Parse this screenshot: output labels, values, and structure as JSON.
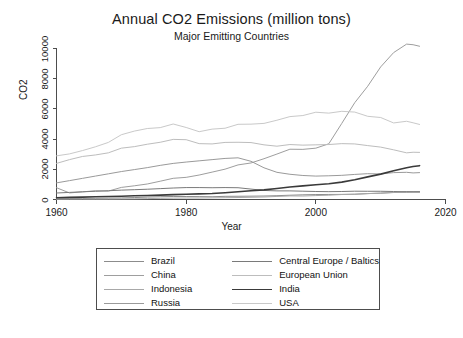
{
  "chart_data": {
    "type": "line",
    "title": "Annual CO2 Emissions (million tons)",
    "subtitle": "Major Emitting Countries",
    "xlabel": "Year",
    "ylabel": "CO2",
    "xlim": [
      1960,
      2020
    ],
    "ylim": [
      0,
      10000
    ],
    "xticks": [
      1960,
      1980,
      2000,
      2020
    ],
    "yticks": [
      0,
      2000,
      4000,
      6000,
      8000,
      10000
    ],
    "xtick_labels": [
      "1960",
      "1980",
      "2000",
      "2020"
    ],
    "ytick_labels": [
      "0",
      "2000",
      "4000",
      "6000",
      "8000",
      "10000"
    ],
    "grid": false,
    "legend_position": "below-plot",
    "legend_columns": 2,
    "x": [
      1960,
      1962,
      1964,
      1966,
      1968,
      1970,
      1972,
      1974,
      1976,
      1978,
      1980,
      1982,
      1984,
      1986,
      1988,
      1990,
      1992,
      1994,
      1996,
      1998,
      2000,
      2002,
      2004,
      2006,
      2008,
      2010,
      2012,
      2014,
      2015,
      2016
    ],
    "series": [
      {
        "name": "Brazil",
        "color": "#8c8c8c",
        "width": 1.0,
        "values": [
          47,
          57,
          64,
          73,
          88,
          103,
          128,
          160,
          183,
          200,
          199,
          191,
          184,
          209,
          214,
          221,
          231,
          253,
          283,
          310,
          328,
          334,
          338,
          353,
          392,
          420,
          462,
          520,
          503,
          487
        ]
      },
      {
        "name": "China",
        "color": "#9e9e9e",
        "width": 1.0,
        "values": [
          780,
          436,
          506,
          578,
          557,
          800,
          907,
          1027,
          1211,
          1404,
          1467,
          1620,
          1813,
          2010,
          2290,
          2420,
          2700,
          3010,
          3330,
          3320,
          3400,
          3690,
          5040,
          6410,
          7500,
          8780,
          9730,
          10290,
          10250,
          10150
        ]
      },
      {
        "name": "Indonesia",
        "color": "#a8a8a8",
        "width": 1.0,
        "values": [
          23,
          26,
          27,
          26,
          29,
          36,
          45,
          57,
          76,
          90,
          99,
          99,
          108,
          119,
          131,
          148,
          166,
          203,
          238,
          232,
          260,
          285,
          330,
          340,
          390,
          420,
          470,
          480,
          490,
          500
        ]
      },
      {
        "name": "Russia",
        "color": "#9a9a9a",
        "width": 1.0,
        "values": [
          1100,
          1250,
          1400,
          1550,
          1700,
          1850,
          1980,
          2110,
          2260,
          2390,
          2480,
          2560,
          2640,
          2720,
          2760,
          2530,
          2100,
          1800,
          1670,
          1590,
          1550,
          1570,
          1600,
          1660,
          1710,
          1690,
          1780,
          1800,
          1760,
          1780
        ]
      },
      {
        "name": "Central Europe / Baltics",
        "color": "#7a7a7a",
        "width": 1.0,
        "values": [
          430,
          470,
          510,
          545,
          580,
          620,
          650,
          680,
          720,
          760,
          790,
          790,
          780,
          790,
          780,
          690,
          600,
          570,
          570,
          550,
          530,
          520,
          530,
          550,
          545,
          545,
          530,
          505,
          510,
          515
        ]
      },
      {
        "name": "European Union",
        "color": "#bdbdbd",
        "width": 1.0,
        "values": [
          2390,
          2640,
          2850,
          2950,
          3090,
          3400,
          3500,
          3660,
          3790,
          3980,
          3960,
          3700,
          3680,
          3780,
          3790,
          3770,
          3620,
          3530,
          3640,
          3600,
          3620,
          3640,
          3700,
          3680,
          3570,
          3470,
          3290,
          3090,
          3130,
          3120
        ]
      },
      {
        "name": "India",
        "color": "#3a3a3a",
        "width": 1.6,
        "values": [
          120,
          140,
          160,
          180,
          200,
          220,
          245,
          265,
          290,
          320,
          345,
          370,
          400,
          450,
          510,
          580,
          640,
          730,
          830,
          900,
          980,
          1040,
          1150,
          1310,
          1500,
          1680,
          1900,
          2100,
          2180,
          2240
        ]
      },
      {
        "name": "USA",
        "color": "#c9c9c9",
        "width": 1.0,
        "values": [
          2890,
          3020,
          3240,
          3490,
          3780,
          4290,
          4530,
          4700,
          4760,
          5000,
          4770,
          4490,
          4660,
          4720,
          4980,
          4990,
          5040,
          5250,
          5490,
          5560,
          5780,
          5720,
          5840,
          5790,
          5510,
          5430,
          5070,
          5180,
          5080,
          4970
        ]
      }
    ]
  }
}
